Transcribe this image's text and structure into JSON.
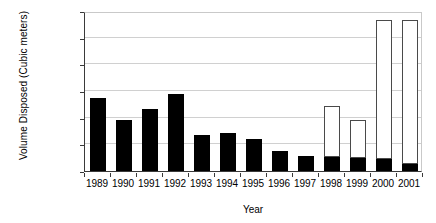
{
  "chart_data": {
    "type": "bar",
    "title": "",
    "xlabel": "Year",
    "ylabel": "Volume Disposed (Cubic meters)",
    "categories": [
      "1989",
      "1990",
      "1991",
      "1992",
      "1993",
      "1994",
      "1995",
      "1996",
      "1997",
      "1998",
      "1999",
      "2000",
      "2001"
    ],
    "ylim": [
      0,
      120000
    ],
    "ytick_labels": [
      "0",
      "20000",
      "40000",
      "60000",
      "80000",
      "100000",
      "120000"
    ],
    "ytick_values": [
      0,
      20000,
      40000,
      60000,
      80000,
      100000,
      120000
    ],
    "grid": true,
    "legend": "none",
    "stacked": true,
    "series": [
      {
        "name": "black-segment",
        "fill": "#000000",
        "values": [
          54750,
          38250,
          46500,
          57750,
          27000,
          28500,
          24000,
          15000,
          11250,
          10500,
          9750,
          9000,
          5250
        ]
      },
      {
        "name": "white-segment",
        "fill": "#ffffff",
        "values": [
          0,
          0,
          0,
          0,
          0,
          0,
          0,
          0,
          0,
          37500,
          27750,
          103500,
          107250
        ]
      }
    ],
    "totals": [
      54750,
      38250,
      46500,
      57750,
      27000,
      28500,
      24000,
      15000,
      11250,
      48000,
      37500,
      112500,
      112500
    ]
  }
}
